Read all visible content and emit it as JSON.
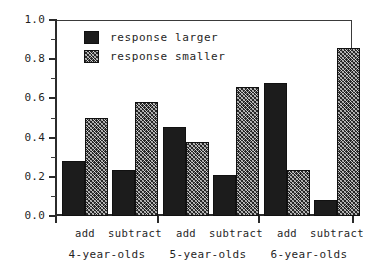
{
  "chart_data": {
    "type": "bar",
    "title": "",
    "xlabel": "",
    "ylabel": "",
    "ylim": [
      0.0,
      1.0
    ],
    "grid": false,
    "legend_position": "top-left inside",
    "y_ticks": [
      "1.0",
      "0.8",
      "0.6",
      "0.4",
      "0.2",
      "0.0"
    ],
    "y_tick_values": [
      1.0,
      0.8,
      0.6,
      0.4,
      0.2,
      0.0
    ],
    "y_minor_tick_values": [
      0.9,
      0.7,
      0.5,
      0.3,
      0.1
    ],
    "groups": [
      "4-year-olds",
      "5-year-olds",
      "6-year-olds"
    ],
    "conditions": [
      "add",
      "subtract"
    ],
    "categories": [
      "4-year-olds add",
      "4-year-olds subtract",
      "5-year-olds add",
      "5-year-olds subtract",
      "6-year-olds add",
      "6-year-olds subtract"
    ],
    "series": [
      {
        "name": "response larger",
        "fill": "solid",
        "color": "#1c1c1c",
        "values": [
          0.28,
          0.235,
          0.455,
          0.21,
          0.68,
          0.08
        ]
      },
      {
        "name": "response smaller",
        "fill": "hatch",
        "color": "#262626",
        "values": [
          0.5,
          0.58,
          0.38,
          0.66,
          0.235,
          0.855
        ]
      }
    ]
  },
  "legend": {
    "items": [
      {
        "label": "response larger",
        "swatch": "solid-square-icon"
      },
      {
        "label": "response smaller",
        "swatch": "hatched-square-icon"
      }
    ]
  },
  "axes": {
    "y_labels": [
      "1.0",
      "0.8",
      "0.6",
      "0.4",
      "0.2",
      "0.0"
    ],
    "condition_labels": [
      "add",
      "subtract",
      "add",
      "subtract",
      "add",
      "subtract"
    ],
    "group_labels": [
      "4-year-olds",
      "5-year-olds",
      "6-year-olds"
    ]
  },
  "colors": {
    "axis": "#2b2b2b",
    "bar_solid": "#1c1c1c",
    "bar_hatch": "#262626",
    "background": "#ffffff"
  }
}
